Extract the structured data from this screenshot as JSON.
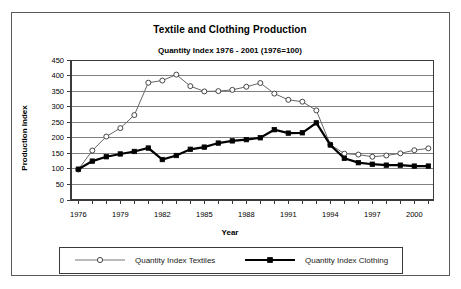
{
  "chart_data": {
    "type": "line",
    "title": "Textile and Clothing Production",
    "subtitle": "Quantity Index 1976 - 2001 (1976=100)",
    "xlabel": "Year",
    "ylabel": "Production Index",
    "grid": true,
    "legend_position": "bottom",
    "ylim": [
      0,
      450
    ],
    "ytick_step": 50,
    "yticks": [
      "0",
      "50",
      "100",
      "150",
      "200",
      "250",
      "300",
      "350",
      "400",
      "450"
    ],
    "xticks": [
      "1976",
      "1979",
      "1982",
      "1985",
      "1988",
      "1991",
      "1994",
      "1997",
      "2000"
    ],
    "x": [
      1976,
      1977,
      1978,
      1979,
      1980,
      1981,
      1982,
      1983,
      1984,
      1985,
      1986,
      1987,
      1988,
      1989,
      1990,
      1991,
      1992,
      1993,
      1994,
      1995,
      1996,
      1997,
      1998,
      1999,
      2000,
      2001
    ],
    "series": [
      {
        "name": "Quantity Index Textiles",
        "color": "#666666",
        "marker": "open-circle",
        "values": [
          98,
          159,
          204,
          231,
          273,
          377,
          384,
          403,
          366,
          349,
          350,
          354,
          364,
          376,
          342,
          322,
          316,
          288,
          178,
          149,
          146,
          139,
          143,
          150,
          160,
          166
        ]
      },
      {
        "name": "Quantity Index Clothing",
        "color": "#000000",
        "marker": "filled-square",
        "values": [
          99,
          125,
          139,
          148,
          156,
          167,
          130,
          143,
          163,
          170,
          183,
          190,
          194,
          200,
          226,
          215,
          216,
          248,
          177,
          134,
          120,
          115,
          112,
          112,
          109,
          109
        ]
      }
    ]
  },
  "legend": {
    "items": [
      {
        "label": "Quantity Index Textiles"
      },
      {
        "label": "Quantity Index Clothing"
      }
    ]
  }
}
